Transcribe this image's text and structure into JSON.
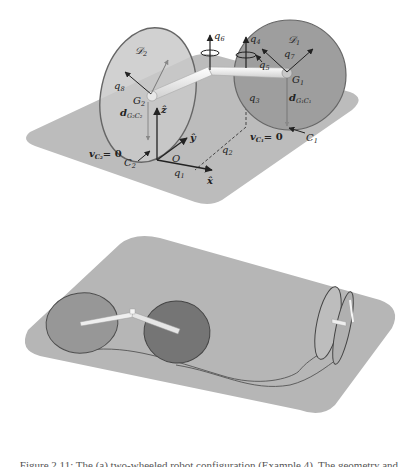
{
  "figure": {
    "top_panel": {
      "disk_left": {
        "label": "𝒟",
        "sub": "2"
      },
      "disk_right": {
        "label": "𝒟",
        "sub": "1"
      },
      "labels": {
        "q1": "q",
        "q1_sub": "1",
        "q2": "q",
        "q2_sub": "2",
        "q3": "q",
        "q3_sub": "3",
        "q4": "q",
        "q4_sub": "4",
        "q5": "q",
        "q5_sub": "5",
        "q6": "q",
        "q6_sub": "6",
        "q7": "q",
        "q7_sub": "7",
        "q8": "q",
        "q8_sub": "8",
        "G1": "G",
        "G1_sub": "1",
        "G2": "G",
        "G2_sub": "2",
        "C1": "C",
        "C1_sub": "1",
        "C2": "C",
        "C2_sub": "2",
        "d1": "d",
        "d1_sub": "G₁C₁",
        "d2": "d",
        "d2_sub": "G₂C₂",
        "vC1": "v",
        "vC1_sub": "C₁",
        "vC1_eq": "= 0",
        "vC2": "v",
        "vC2_sub": "C₂",
        "vC2_eq": "= 0",
        "origin": "O",
        "axis_x": "x̂",
        "axis_y": "ŷ",
        "axis_z": "ẑ"
      }
    },
    "bottom_panel": {
      "description": "two-wheeled robot with trajectory curve on plane"
    },
    "caption": "Figure 2.11: The (a) two-wheeled robot configuration (Example 4). The geometry and"
  },
  "colors": {
    "plane": "#b9b9b9",
    "disk_light": "#c4c4c4",
    "disk_mid": "#a9a9a9",
    "disk_dark": "#8a8a8a",
    "axle": "#f2f2f2",
    "outline": "#555555",
    "ink": "#222222"
  }
}
